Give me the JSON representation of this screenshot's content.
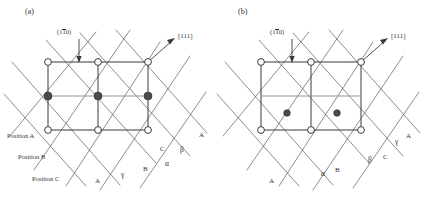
{
  "figure": {
    "background": "#ffffff",
    "line_color": "#55555f",
    "cell_color": "#3a3a42",
    "node_fill": "#ffffff",
    "node_stroke": "#3a3a42",
    "atom_fill": "#4a4a52"
  },
  "panels": [
    {
      "id": "a",
      "tag": "(a)",
      "miller_plane": {
        "prefix": "(1",
        "overbar": "1",
        "suffix": "0)"
      },
      "direction": "[111]",
      "position_labels": [
        "Position A",
        "Position B",
        "Position C"
      ],
      "trace_labels": [
        "A",
        "γ",
        "B",
        "α",
        "C",
        "β",
        "A"
      ],
      "open_nodes": 6,
      "filled_atoms": 3,
      "atom_row": "middle"
    },
    {
      "id": "b",
      "tag": "(b)",
      "miller_plane": {
        "prefix": "(1",
        "overbar": "1",
        "suffix": "0)"
      },
      "direction": "[111]",
      "position_labels": [],
      "trace_labels": [
        "A",
        "α",
        "B",
        "β",
        "C",
        "γ",
        "A"
      ],
      "open_nodes": 6,
      "filled_atoms": 2,
      "atom_row": "lower"
    }
  ]
}
